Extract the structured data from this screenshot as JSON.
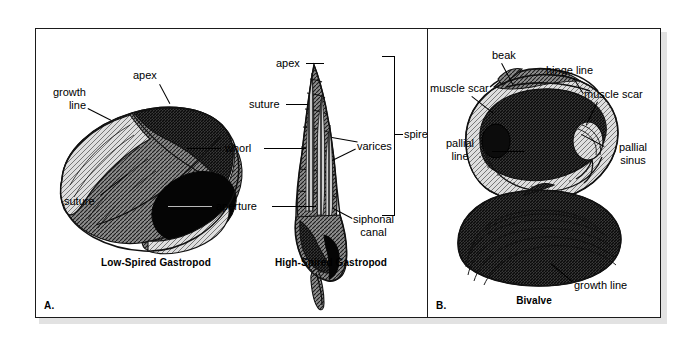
{
  "figure": {
    "background_color": "#ffffff",
    "border_color": "#1b1b1b",
    "shadow_color": "#e2e2e2",
    "ink_color": "#000000"
  },
  "panel_a": {
    "letter": "A.",
    "captions": {
      "low_spired": "Low-Spired Gastropod",
      "high_spired": "High-Spired Gastropod"
    },
    "labels": {
      "growth_line_1": "growth",
      "growth_line_2": "line",
      "apex_low": "apex",
      "suture_low": "suture",
      "apex_high": "apex",
      "suture_high": "suture",
      "whorl": "whorl",
      "varices": "varices",
      "aperture": "aperture",
      "spire": "spire",
      "siphonal_1": "siphonal",
      "siphonal_2": "canal"
    }
  },
  "panel_b": {
    "letter": "B.",
    "caption": "Bivalve",
    "labels": {
      "beak": "beak",
      "hinge_line": "hinge line",
      "muscle_scar_left": "muscle scar",
      "muscle_scar_right": "muscle scar",
      "pallial_line_1": "pallial",
      "pallial_line_2": "line",
      "pallial_sinus_1": "pallial",
      "pallial_sinus_2": "sinus",
      "growth_line": "growth line"
    }
  }
}
